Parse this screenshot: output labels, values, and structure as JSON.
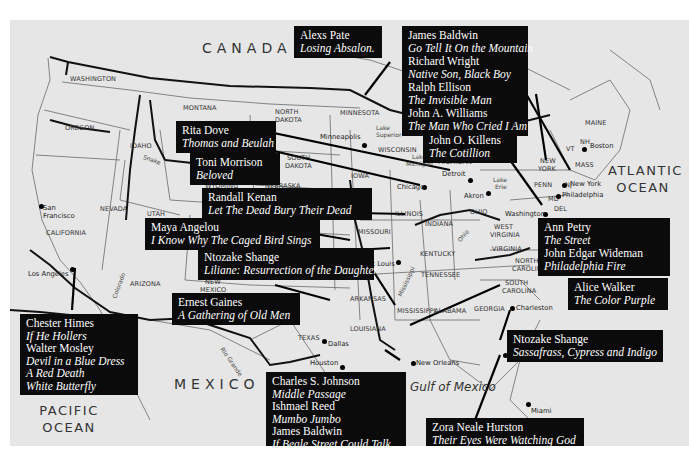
{
  "map": {
    "regions": {
      "canada": "CANADA",
      "mexico": "MEXICO",
      "pacific": "PACIFIC OCEAN",
      "atlantic": "ATLANTIC OCEAN",
      "gulf": "Gulf of Mexico"
    },
    "states": {
      "washington": "WASHINGTON",
      "oregon": "OREGON",
      "california": "CALIFORNIA",
      "nevada": "NEVADA",
      "idaho": "IDAHO",
      "montana": "MONTANA",
      "wyoming": "WYOMING",
      "utah": "UTAH",
      "arizona": "ARIZONA",
      "new_mexico_1": "NEW",
      "new_mexico_2": "MEXICO",
      "north_dakota_1": "NORTH",
      "north_dakota_2": "DAKOTA",
      "south_dakota_1": "SOUTH",
      "south_dakota_2": "DAKOTA",
      "nebraska": "NEBRASKA",
      "kansas": "KANSAS",
      "oklahoma": "OKLAHOMA",
      "texas": "TEXAS",
      "minnesota": "MINNESOTA",
      "iowa": "IOWA",
      "missouri": "MISSOURI",
      "arkansas": "ARKANSAS",
      "louisiana": "LOUISIANA",
      "wisconsin": "WISCONSIN",
      "illinois": "ILLINOIS",
      "michigan": "MICHIGAN",
      "indiana": "INDIANA",
      "ohio": "OHIO",
      "kentucky": "KENTUCKY",
      "tennessee": "TENNESSEE",
      "mississippi": "MISSISSIPPI",
      "alabama": "ALABAMA",
      "georgia": "GEORGIA",
      "florida": "FLORIDA",
      "south_carolina_1": "SOUTH",
      "south_carolina_2": "CAROLINA",
      "north_carolina_1": "NORTH",
      "north_carolina_2": "CAROLINA",
      "virginia": "VIRGINIA",
      "west_virginia_1": "WEST",
      "west_virginia_2": "VIRGINIA",
      "penn": "PENN",
      "new_york_1": "NEW",
      "new_york_2": "YORK",
      "maine": "MAINE",
      "vt": "VT",
      "nh": "NH",
      "mass": "MASS",
      "md": "MD",
      "del": "DEL",
      "nj": "NJ"
    },
    "water": {
      "lake_superior_1": "Lake",
      "lake_superior_2": "Superior",
      "lake_michigan_1": "Lake",
      "lake_michigan_2": "Michigan",
      "lake_erie_1": "Lake",
      "lake_erie_2": "Erie",
      "snake": "Snake",
      "colorado": "Colorado",
      "rio_grande": "Rio Grande",
      "mississippi_river": "Mississippi",
      "ohio_river": "Ohio"
    },
    "cities": {
      "san_francisco_1": "San",
      "san_francisco_2": "Francisco",
      "los_angeles": "Los Angeles",
      "minneapolis": "Minneapolis",
      "chicago": "Chicago",
      "detroit": "Detroit",
      "akron": "Akron",
      "st_louis": "St Louis",
      "dallas": "Dallas",
      "houston": "Houston",
      "new_orleans": "New Orleans",
      "washington": "Washington",
      "philadelphia": "Philadelphia",
      "new_york": "New York",
      "boston": "Boston",
      "charleston": "Charleston",
      "eatonville": "Eatonville",
      "miami": "Miami"
    }
  },
  "callouts": [
    {
      "id": "baldwin-wright",
      "entries": [
        {
          "author": "James Baldwin",
          "title": "Go Tell It On the Mountain"
        },
        {
          "author": "Richard Wright",
          "title": "Native Son, Black Boy"
        },
        {
          "author": "Ralph Ellison",
          "title": "The Invisible Man"
        },
        {
          "author": "John A. Williams",
          "title": "The Man Who Cried I Am"
        }
      ]
    },
    {
      "id": "pate",
      "entries": [
        {
          "author": "Alexs Pate",
          "title": "Losing Absalon."
        }
      ]
    },
    {
      "id": "dove",
      "entries": [
        {
          "author": "Rita Dove",
          "title": "Thomas and Beulah"
        }
      ]
    },
    {
      "id": "morrison",
      "entries": [
        {
          "author": "Toni Morrison",
          "title": "Beloved"
        }
      ]
    },
    {
      "id": "killens",
      "entries": [
        {
          "author": "John O. Killens",
          "title": "The Cotillion"
        }
      ]
    },
    {
      "id": "kenan",
      "entries": [
        {
          "author": "Randall Kenan",
          "title": "Let The Dead Bury Their Dead"
        }
      ]
    },
    {
      "id": "angelou",
      "entries": [
        {
          "author": "Maya Angelou",
          "title": "I Know Why The Caged Bird Sings"
        }
      ]
    },
    {
      "id": "shange-liliane",
      "entries": [
        {
          "author": "Ntozake Shange",
          "title": "Liliane: Resurrection of the Daughter"
        }
      ]
    },
    {
      "id": "petry-wideman",
      "entries": [
        {
          "author": "Ann Petry",
          "title": "The Street"
        },
        {
          "author": "John Edgar Wideman",
          "title": "Philadelphia Fire"
        }
      ]
    },
    {
      "id": "gaines",
      "entries": [
        {
          "author": "Ernest Gaines",
          "title": "A Gathering of Old Men"
        }
      ]
    },
    {
      "id": "walker",
      "entries": [
        {
          "author": "Alice Walker",
          "title": "The Color Purple"
        }
      ]
    },
    {
      "id": "himes-mosley",
      "entries": [
        {
          "author": "Chester Himes",
          "title": "If He Hollers"
        },
        {
          "author": "Walter Mosley",
          "title": "Devil in a Blue Dress"
        },
        {
          "author": "",
          "title": "A Red Death"
        },
        {
          "author": "",
          "title": "White Butterfly"
        }
      ]
    },
    {
      "id": "shange-sassafrass",
      "entries": [
        {
          "author": "Ntozake Shange",
          "title": "Sassafrass, Cypress and Indigo"
        }
      ]
    },
    {
      "id": "johnson-reed-baldwin",
      "entries": [
        {
          "author": "Charles S. Johnson",
          "title": "Middle Passage"
        },
        {
          "author": "Ishmael Reed",
          "title": "Mumbo Jumbo"
        },
        {
          "author": "James Baldwin",
          "title": "If Beale Street Could Talk"
        }
      ]
    },
    {
      "id": "hurston",
      "entries": [
        {
          "author": "Zora Neale Hurston",
          "title": "Their Eyes Were Watching God"
        }
      ]
    }
  ]
}
